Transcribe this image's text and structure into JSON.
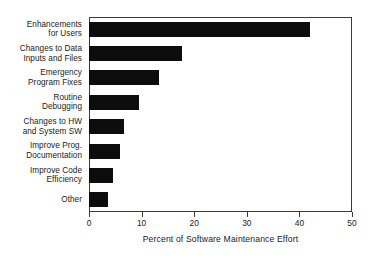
{
  "chart_data": {
    "type": "bar",
    "orientation": "horizontal",
    "title": "",
    "xlabel": "Percent of Software Maintenance Effort",
    "ylabel": "",
    "xlim": [
      0,
      50
    ],
    "xticks": [
      0,
      10,
      20,
      30,
      40,
      50
    ],
    "xtick_labels": [
      "0",
      "10",
      "20",
      "30",
      "40",
      "50"
    ],
    "grid": false,
    "legend": false,
    "bar_color": "#0d0d0d",
    "frame_color": "#3b3b3b",
    "categories": [
      "Enhancements\nfor Users",
      "Changes to Data\nInputs and Files",
      "Emergency\nProgram Fixes",
      "Routine\nDebugging",
      "Changes to HW\nand System SW",
      "Improve Prog.\nDocumentation",
      "Improve Code\nEfficiency",
      "Other"
    ],
    "values": [
      42.0,
      17.7,
      13.3,
      9.5,
      6.7,
      5.9,
      4.5,
      3.7
    ]
  }
}
